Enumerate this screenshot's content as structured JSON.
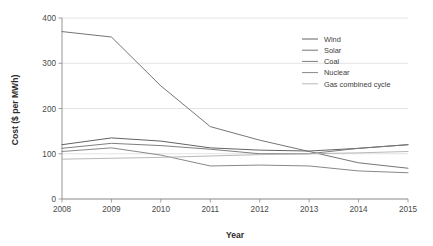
{
  "chart_data": {
    "type": "line",
    "title": "",
    "xlabel": "Year",
    "ylabel": "Cost ($ per MWh)",
    "x": [
      2008,
      2009,
      2010,
      2011,
      2012,
      2013,
      2014,
      2015
    ],
    "xtick_labels": [
      "2008",
      "2009",
      "2010",
      "2011",
      "2012",
      "2013",
      "2014",
      "2015"
    ],
    "ytick_labels": [
      "0",
      "100",
      "200",
      "300",
      "400"
    ],
    "ytick_values": [
      0,
      100,
      200,
      300,
      400
    ],
    "xlim": [
      2008,
      2015
    ],
    "ylim": [
      0,
      400
    ],
    "grid": true,
    "grid_axis": "y",
    "legend_position": "upper-right",
    "series": [
      {
        "name": "Wind",
        "color": "#5a5a5a",
        "values": [
          120,
          135,
          128,
          113,
          108,
          106,
          112,
          120
        ]
      },
      {
        "name": "Solar",
        "color": "#6e6e6e",
        "values": [
          370,
          358,
          250,
          160,
          130,
          105,
          80,
          68
        ]
      },
      {
        "name": "Coal",
        "color": "#777777",
        "values": [
          112,
          123,
          118,
          110,
          100,
          100,
          112,
          120
        ]
      },
      {
        "name": "Nuclear",
        "color": "#828282",
        "values": [
          105,
          113,
          97,
          73,
          75,
          73,
          62,
          58
        ]
      },
      {
        "name": "Gas combined cycle",
        "color": "#b4b4b4",
        "values": [
          88,
          90,
          92,
          95,
          98,
          100,
          102,
          105
        ]
      }
    ]
  }
}
